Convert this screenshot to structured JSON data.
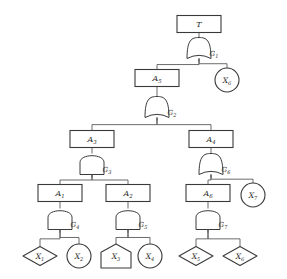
{
  "diagram": {
    "top_event": {
      "id": "T",
      "label": "T",
      "shape": "rect"
    },
    "nodes": [
      {
        "key": "T",
        "label": "T",
        "sub": "",
        "shape": "rect",
        "cx": 199,
        "cy": 24
      },
      {
        "key": "A5",
        "label": "A",
        "sub": "5",
        "shape": "rect",
        "cx": 157,
        "cy": 78
      },
      {
        "key": "X6a",
        "label": "X",
        "sub": "6",
        "shape": "circle",
        "cx": 227,
        "cy": 80
      },
      {
        "key": "A3",
        "label": "A",
        "sub": "3",
        "shape": "rect",
        "cx": 92,
        "cy": 139
      },
      {
        "key": "A4",
        "label": "A",
        "sub": "4",
        "shape": "rect",
        "cx": 211,
        "cy": 139
      },
      {
        "key": "A1",
        "label": "A",
        "sub": "1",
        "shape": "rect",
        "cx": 60,
        "cy": 193
      },
      {
        "key": "A2",
        "label": "A",
        "sub": "2",
        "shape": "rect",
        "cx": 128,
        "cy": 193
      },
      {
        "key": "A6",
        "label": "A",
        "sub": "6",
        "shape": "rect",
        "cx": 208,
        "cy": 193
      },
      {
        "key": "X7",
        "label": "X",
        "sub": "7",
        "shape": "circle",
        "cx": 253,
        "cy": 195
      },
      {
        "key": "X1",
        "label": "X",
        "sub": "1",
        "shape": "diamond",
        "cx": 40,
        "cy": 256
      },
      {
        "key": "X2",
        "label": "X",
        "sub": "2",
        "shape": "circle",
        "cx": 79,
        "cy": 256
      },
      {
        "key": "X3",
        "label": "X",
        "sub": "3",
        "shape": "house",
        "cx": 116,
        "cy": 256
      },
      {
        "key": "X4",
        "label": "X",
        "sub": "4",
        "shape": "circle",
        "cx": 150,
        "cy": 256
      },
      {
        "key": "X5",
        "label": "X",
        "sub": "5",
        "shape": "diamond",
        "cx": 196,
        "cy": 256
      },
      {
        "key": "X6b",
        "label": "X",
        "sub": "6",
        "shape": "diamond",
        "cx": 240,
        "cy": 256
      }
    ],
    "gates": [
      {
        "key": "G1",
        "label": "G",
        "sub": "1",
        "type": "or",
        "cx": 199,
        "cy": 48,
        "label_x": 214,
        "label_y": 56
      },
      {
        "key": "G2",
        "label": "G",
        "sub": "2",
        "type": "or",
        "cx": 157,
        "cy": 107,
        "label_x": 172,
        "label_y": 115
      },
      {
        "key": "G3",
        "label": "G",
        "sub": "3",
        "type": "and",
        "cx": 92,
        "cy": 164,
        "label_x": 107,
        "label_y": 172
      },
      {
        "key": "G6",
        "label": "G",
        "sub": "6",
        "type": "or",
        "cx": 211,
        "cy": 164,
        "label_x": 226,
        "label_y": 172
      },
      {
        "key": "G4",
        "label": "G",
        "sub": "4",
        "type": "and",
        "cx": 60,
        "cy": 219,
        "label_x": 75,
        "label_y": 227
      },
      {
        "key": "G5",
        "label": "G",
        "sub": "5",
        "type": "and",
        "cx": 128,
        "cy": 219,
        "label_x": 143,
        "label_y": 227
      },
      {
        "key": "G7",
        "label": "G",
        "sub": "7",
        "type": "and",
        "cx": 208,
        "cy": 219,
        "label_x": 223,
        "label_y": 227
      }
    ],
    "edges": [
      {
        "from": "T",
        "to": "G1"
      },
      {
        "from": "G1",
        "to": "A5"
      },
      {
        "from": "G1",
        "to": "X6a"
      },
      {
        "from": "A5",
        "to": "G2"
      },
      {
        "from": "G2",
        "to": "A3"
      },
      {
        "from": "G2",
        "to": "A4"
      },
      {
        "from": "A3",
        "to": "G3"
      },
      {
        "from": "G3",
        "to": "A1"
      },
      {
        "from": "G3",
        "to": "A2"
      },
      {
        "from": "A1",
        "to": "G4"
      },
      {
        "from": "G4",
        "to": "X1"
      },
      {
        "from": "G4",
        "to": "X2"
      },
      {
        "from": "A2",
        "to": "G5"
      },
      {
        "from": "G5",
        "to": "X3"
      },
      {
        "from": "G5",
        "to": "X4"
      },
      {
        "from": "A4",
        "to": "G6"
      },
      {
        "from": "G6",
        "to": "A6"
      },
      {
        "from": "G6",
        "to": "X7"
      },
      {
        "from": "A6",
        "to": "G7"
      },
      {
        "from": "G7",
        "to": "X5"
      },
      {
        "from": "G7",
        "to": "X6b"
      }
    ],
    "colors": {
      "stroke": "#3a3a3a",
      "wire": "#5a5a5a",
      "fill": "#ffffff",
      "text": "#2c2c2c",
      "background": "#ffffff"
    }
  }
}
